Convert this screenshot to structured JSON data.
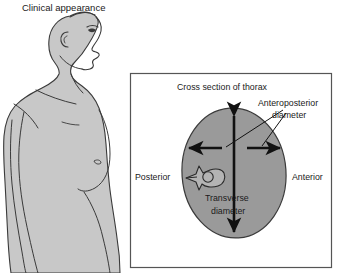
{
  "figure": {
    "title": "Clinical appearance",
    "panel": {
      "title": "Cross section of thorax",
      "labels": {
        "anteroposterior_line1": "Anteroposterior",
        "anteroposterior_line2": "diameter",
        "transverse_line1": "Transverse",
        "transverse_line2": "diameter",
        "posterior": "Posterior",
        "anterior": "Anterior"
      }
    },
    "colors": {
      "body_fill": "#c8c8c8",
      "thorax_fill": "#9a9a9a",
      "vertebra_fill": "#b4b4b4",
      "outline": "#3a3a3a",
      "arrow": "#111111",
      "panel_border": "#555555",
      "text": "#1a1a1a",
      "background": "#ffffff"
    },
    "icons": {
      "anteroposterior_arrow": "vertical-double-arrow-icon",
      "transverse_arrow_left": "left-arrow-icon",
      "transverse_arrow_right": "right-arrow-icon",
      "vertebra": "vertebra-icon",
      "body_profile": "human-profile-icon"
    }
  }
}
